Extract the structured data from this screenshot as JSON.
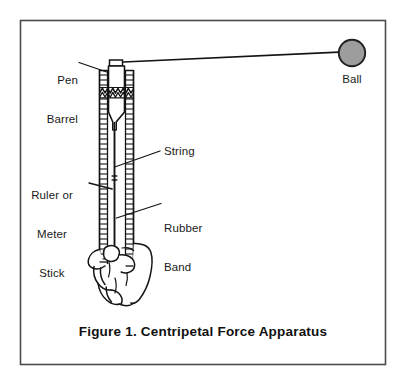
{
  "figure": {
    "caption": "Figure 1.  Centripetal Force Apparatus",
    "border_color": "#3a3a3a",
    "ink_color": "#1a1a1a",
    "background_color": "#ffffff"
  },
  "labels": {
    "pen_barrel": "Pen\nBarrel",
    "pen_barrel_line1": "Pen",
    "pen_barrel_line2": "Barrel",
    "ball": "Ball",
    "string": "String",
    "ruler": "Ruler or\nMeter\nStick",
    "ruler_line1": "Ruler or",
    "ruler_line2": "Meter",
    "ruler_line3": "Stick",
    "rubber_band": "Rubber\nBand",
    "rubber_band_line1": "Rubber",
    "rubber_band_line2": "Band"
  },
  "parts": {
    "ball": {
      "name": "Ball",
      "fill": "#9a9a9a",
      "stroke": "#111111",
      "center_x": 352,
      "center_y": 53,
      "radius": 13
    },
    "string": {
      "name": "String",
      "from_x": 113,
      "from_y": 62,
      "to_x": 339,
      "to_y": 52
    },
    "ruler": {
      "name": "Ruler or Meter Stick",
      "left_x": 99,
      "right_x": 134,
      "top_y": 70,
      "bottom_y": 262,
      "tick_spacing": 5
    },
    "pen_barrel": {
      "name": "Pen Barrel",
      "left_x": 108,
      "right_x": 124,
      "top_y": 60,
      "bottom_y": 130
    },
    "rubber_band": {
      "name": "Rubber Band",
      "top_y": 87,
      "bottom_y": 97
    },
    "hand": {
      "name": "Hand gripping ruler"
    }
  }
}
